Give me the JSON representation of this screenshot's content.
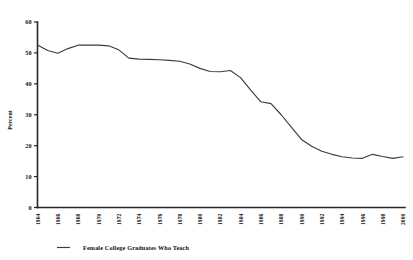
{
  "chart_data": {
    "type": "line",
    "title": "",
    "xlabel": "",
    "ylabel": "Percent",
    "ylim": [
      0,
      60
    ],
    "yticks": [
      0,
      10,
      20,
      30,
      40,
      50,
      60
    ],
    "grid": false,
    "legend_position": "bottom-left",
    "legend": [
      "Female College Graduates Who Teach"
    ],
    "categories": [
      "1964",
      "1965",
      "1966",
      "1967",
      "1968",
      "1969",
      "1970",
      "1971",
      "1972",
      "1973",
      "1974",
      "1975",
      "1976",
      "1977",
      "1978",
      "1979",
      "1980",
      "1981",
      "1982",
      "1983",
      "1984",
      "1985",
      "1986",
      "1987",
      "1988",
      "1989",
      "1990",
      "1991",
      "1992",
      "1993",
      "1994",
      "1995",
      "1996",
      "1997",
      "1998",
      "1999",
      "2000"
    ],
    "xtick_labels": [
      "1964",
      "1966",
      "1968",
      "1970",
      "1972",
      "1974",
      "1976",
      "1978",
      "1980",
      "1982",
      "1984",
      "1986",
      "1988",
      "1990",
      "1992",
      "1994",
      "1996",
      "1998",
      "2000"
    ],
    "series": [
      {
        "name": "Female College Graduates Who Teach",
        "color": "#3c3c3c",
        "values": [
          52.6,
          50.8,
          49.9,
          51.4,
          52.5,
          52.5,
          52.5,
          52.3,
          51.0,
          48.3,
          48.0,
          47.9,
          47.8,
          47.6,
          47.3,
          46.4,
          45.0,
          44.0,
          43.9,
          44.3,
          42.0,
          38.0,
          34.2,
          33.6,
          30.0,
          26.0,
          22.0,
          19.8,
          18.2,
          17.2,
          16.4,
          16.0,
          15.9,
          17.2,
          16.5,
          15.9,
          16.4
        ]
      }
    ]
  },
  "axis": {
    "y_title": "Percent"
  },
  "legend": {
    "entry_label": "Female College Graduates Who Teach",
    "marker": "line-dash-marker"
  }
}
